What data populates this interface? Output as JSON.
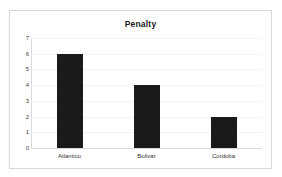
{
  "chart_data": {
    "type": "bar",
    "title": "Penalty",
    "xlabel": "",
    "ylabel": "",
    "categories": [
      "Atlantico",
      "Bolivar",
      "Cordoba"
    ],
    "values": [
      6,
      4,
      2
    ],
    "ylim": [
      0,
      7
    ],
    "ytick_labels": [
      "7",
      "6",
      "5",
      "4",
      "3",
      "2",
      "1",
      "0"
    ],
    "ytick_values": [
      7,
      6,
      5,
      4,
      3,
      2,
      1,
      0
    ],
    "grid": true,
    "legend": false,
    "bar_color": "#1a1a1a",
    "gridline_color": "#f2f2f2",
    "border_color": "#d9d9d9",
    "background_color": "#ffffff"
  }
}
